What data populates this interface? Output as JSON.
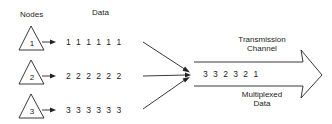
{
  "labels": {
    "nodes_header": "Nodes",
    "data_header": "Data",
    "channel_line1": "Transmission",
    "channel_line2": "Channel",
    "mux_line1": "Multiplexed",
    "mux_line2": "Data"
  },
  "nodes": [
    {
      "id": "1",
      "data": "1 1 1 1 1 1"
    },
    {
      "id": "2",
      "data": "2 2 2 2 2 2"
    },
    {
      "id": "3",
      "data": "3 3 3 3 3 3"
    }
  ],
  "multiplexed_sequence": "3 3 2 3 2 1",
  "colors": {
    "stroke": "#222222",
    "text": "#222222",
    "background": "#ffffff"
  }
}
